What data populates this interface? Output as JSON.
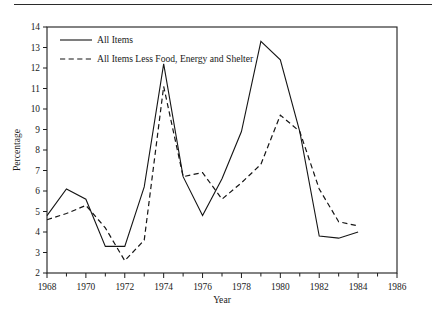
{
  "chart_data": {
    "type": "line",
    "title": "",
    "xlabel": "Year",
    "ylabel": "Percentage",
    "xlim": [
      1968,
      1986
    ],
    "ylim": [
      2,
      14
    ],
    "grid": false,
    "legend_position": "top-left inside",
    "x": [
      1968,
      1969,
      1970,
      1971,
      1972,
      1973,
      1974,
      1975,
      1976,
      1977,
      1978,
      1979,
      1980,
      1981,
      1982,
      1983,
      1984
    ],
    "xticks": [
      1968,
      1970,
      1972,
      1974,
      1976,
      1978,
      1980,
      1982,
      1984,
      1986
    ],
    "xtick_labels": [
      "1968",
      "1970",
      "1972",
      "1974",
      "1976",
      "1978",
      "1980",
      "1982",
      "1984",
      "1986"
    ],
    "xminor_step": 1,
    "yticks": [
      2,
      3,
      4,
      5,
      6,
      7,
      8,
      9,
      10,
      11,
      12,
      13,
      14
    ],
    "ytick_labels": [
      "2",
      "3",
      "4",
      "5",
      "6",
      "7",
      "8",
      "9",
      "10",
      "11",
      "12",
      "13",
      "14"
    ],
    "series": [
      {
        "name": "All Items",
        "style": "solid",
        "color": "#151515",
        "values": [
          4.8,
          6.1,
          5.6,
          3.3,
          3.3,
          6.2,
          12.2,
          6.7,
          4.8,
          6.6,
          8.9,
          13.3,
          12.4,
          8.9,
          3.8,
          3.7,
          4.0
        ]
      },
      {
        "name": "All Items Less Food, Energy and Shelter",
        "style": "dashed",
        "color": "#151515",
        "values": [
          4.6,
          4.9,
          5.3,
          4.2,
          2.6,
          3.6,
          11.1,
          6.7,
          6.9,
          5.6,
          6.4,
          7.3,
          9.7,
          8.9,
          6.1,
          4.5,
          4.3
        ]
      }
    ]
  },
  "legend": {
    "entries": [
      {
        "label": "All Items"
      },
      {
        "label": "All Items Less Food, Energy and Shelter"
      }
    ]
  },
  "axes": {
    "x_title": "Year",
    "y_title": "Percentage"
  }
}
